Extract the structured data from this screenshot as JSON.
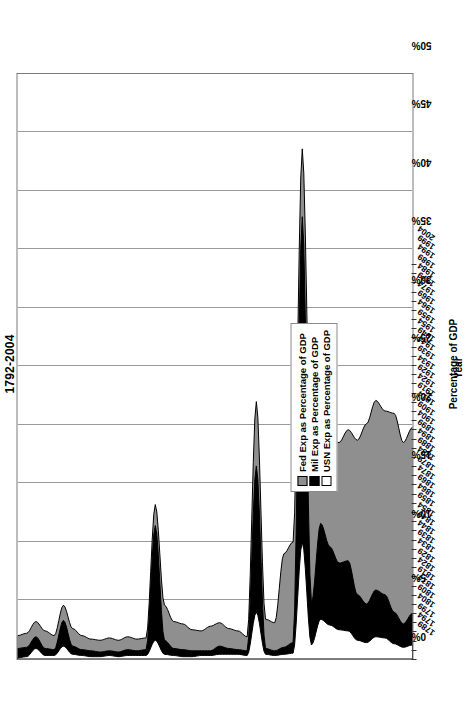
{
  "chart_data": {
    "type": "area",
    "title": "1792-2004",
    "xlabel": "Year",
    "ylabel": "Percentage of GDP",
    "xlim": [
      1789,
      2004
    ],
    "ylim": [
      0,
      50
    ],
    "ytick_labels": [
      "0%",
      "5%",
      "10%",
      "15%",
      "20%",
      "25%",
      "30%",
      "35%",
      "40%",
      "45%",
      "50%"
    ],
    "ytick_values": [
      0,
      5,
      10,
      15,
      20,
      25,
      30,
      35,
      40,
      45,
      50
    ],
    "grid": "vertical-major",
    "legend_position": "left-center",
    "legend": [
      {
        "label": "Fed Exp as Percentage of GDP",
        "color": "#8f8f8f"
      },
      {
        "label": "Mil Exp as Percentage of GDP",
        "color": "#000000"
      },
      {
        "label": "USN Exp as Percentage of GDP",
        "color": "#ffffff"
      }
    ],
    "xtick_labels": [
      "1789",
      "1794",
      "1799",
      "1804",
      "1809",
      "1814",
      "1819",
      "1824",
      "1829",
      "1834",
      "1839",
      "1844",
      "1849",
      "1854",
      "1859",
      "1864",
      "1869",
      "1874",
      "1879",
      "1884",
      "1889",
      "1894",
      "1899",
      "1904",
      "1909",
      "1914",
      "1919",
      "1924",
      "1929",
      "1934",
      "1939",
      "1944",
      "1949",
      "1954",
      "1959",
      "1964",
      "1969",
      "1974",
      "1979",
      "1984",
      "1989",
      "1994",
      "1999",
      "2004"
    ],
    "x": [
      1789,
      1794,
      1799,
      1804,
      1809,
      1814,
      1819,
      1824,
      1829,
      1834,
      1839,
      1844,
      1849,
      1854,
      1859,
      1864,
      1869,
      1874,
      1879,
      1884,
      1889,
      1894,
      1899,
      1904,
      1909,
      1914,
      1919,
      1924,
      1929,
      1934,
      1939,
      1944,
      1949,
      1954,
      1959,
      1964,
      1969,
      1974,
      1979,
      1984,
      1989,
      1994,
      1999,
      2004
    ],
    "series": [
      {
        "name": "Fed Exp as Percentage of GDP",
        "color": "#8f8f8f",
        "values": [
          2.0,
          2.2,
          3.2,
          2.4,
          2.0,
          4.6,
          2.6,
          2.0,
          1.7,
          1.6,
          1.8,
          1.6,
          1.9,
          1.7,
          1.8,
          13.2,
          4.6,
          3.2,
          3.0,
          2.5,
          2.4,
          2.8,
          3.1,
          2.6,
          2.4,
          1.9,
          22.0,
          3.4,
          3.1,
          9.0,
          10.0,
          43.6,
          15.5,
          18.4,
          18.8,
          18.5,
          19.6,
          18.7,
          20.1,
          22.1,
          21.2,
          21.0,
          18.5,
          19.8
        ]
      },
      {
        "name": "Mil Exp as Percentage of GDP",
        "color": "#000000",
        "values": [
          0.9,
          1.0,
          1.9,
          0.9,
          0.8,
          3.3,
          1.1,
          0.8,
          0.7,
          0.6,
          0.7,
          0.6,
          0.8,
          0.7,
          0.8,
          11.4,
          1.6,
          0.9,
          0.8,
          0.7,
          0.7,
          0.7,
          1.1,
          0.9,
          0.8,
          0.7,
          16.5,
          0.9,
          0.7,
          1.0,
          1.4,
          37.8,
          4.8,
          11.6,
          9.6,
          8.2,
          8.4,
          5.5,
          4.7,
          5.9,
          5.5,
          4.0,
          3.0,
          3.9
        ]
      },
      {
        "name": "USN Exp as Percentage of GDP",
        "color": "#ffffff",
        "values": [
          0.1,
          0.2,
          0.9,
          0.3,
          0.3,
          1.1,
          0.4,
          0.3,
          0.2,
          0.2,
          0.3,
          0.2,
          0.3,
          0.3,
          0.3,
          1.6,
          0.4,
          0.3,
          0.2,
          0.2,
          0.3,
          0.3,
          0.4,
          0.4,
          0.4,
          0.3,
          4.0,
          0.4,
          0.3,
          0.4,
          0.5,
          10.0,
          1.2,
          3.4,
          2.9,
          2.5,
          2.4,
          1.6,
          1.4,
          1.9,
          1.8,
          1.3,
          1.0,
          1.2
        ]
      }
    ]
  }
}
